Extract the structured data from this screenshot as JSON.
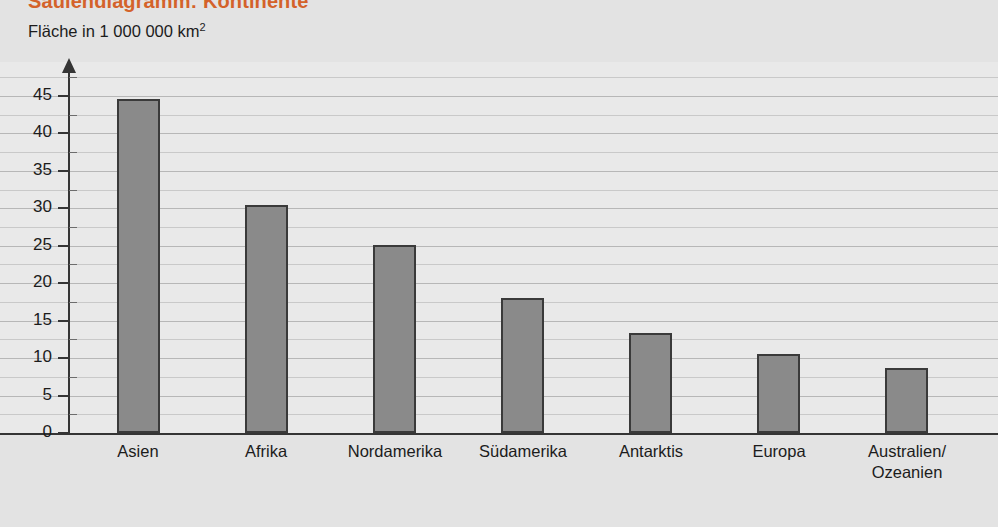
{
  "header": {
    "title": "Säulendiagramm: Kontinente",
    "unit_label_prefix": "Fläche in 1 000 000 km",
    "unit_label_exponent": "2"
  },
  "colors": {
    "title": "#d4622a",
    "bar_fill": "#8a8a8a",
    "bar_stroke": "#3a3a3a",
    "plot_background": "#e9e9e9",
    "page_background": "#e3e3e3",
    "gridline_major": "#b7b7b7",
    "gridline_minor": "#c9c9c9",
    "axis": "#353535"
  },
  "chart_data": {
    "type": "bar",
    "title": "Säulendiagramm: Kontinente",
    "subtitle": "",
    "xlabel": "",
    "ylabel": "Fläche in 1 000 000 km²",
    "ylim": [
      0,
      48
    ],
    "grid": true,
    "legend": "none",
    "y_ticks": [
      0,
      5,
      10,
      15,
      20,
      25,
      30,
      35,
      40,
      45
    ],
    "y_tick_labels": [
      "0",
      "5",
      "10",
      "15",
      "20",
      "25",
      "30",
      "35",
      "40",
      "45"
    ],
    "y_minor_tick_step": 2.5,
    "categories": [
      "Asien",
      "Afrika",
      "Nordamerika",
      "Südamerika",
      "Antarktis",
      "Europa",
      "Australien/\nOzeanien"
    ],
    "category_lines": [
      [
        "Asien"
      ],
      [
        "Afrika"
      ],
      [
        "Nordamerika"
      ],
      [
        "Südamerika"
      ],
      [
        "Antarktis"
      ],
      [
        "Europa"
      ],
      [
        "Australien/",
        "Ozeanien"
      ]
    ],
    "values": [
      44.6,
      30.4,
      25.1,
      18.0,
      13.4,
      10.6,
      8.7
    ],
    "series": [
      {
        "name": "Fläche",
        "values": [
          44.6,
          30.4,
          25.1,
          18.0,
          13.4,
          10.6,
          8.7
        ]
      }
    ]
  },
  "geometry": {
    "bar_width": 43,
    "bar_first_left": 117,
    "bar_pitch": 128,
    "baseline_y": 371,
    "px_per_unit": 7.49,
    "cat_label_centers": [
      138,
      266,
      395,
      523,
      651,
      779,
      907
    ]
  }
}
